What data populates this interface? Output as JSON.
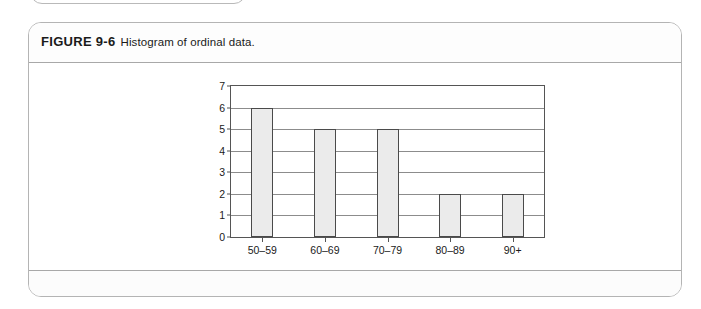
{
  "figure": {
    "label": "FIGURE 9-6",
    "description": "Histogram of ordinal data."
  },
  "chart_data": {
    "type": "bar",
    "title": "Histogram of ordinal data.",
    "categories": [
      "50–59",
      "60–69",
      "70–79",
      "80–89",
      "90+"
    ],
    "values": [
      6,
      5,
      5,
      2,
      2
    ],
    "xlabel": "",
    "ylabel": "",
    "ylim": [
      0,
      7
    ],
    "ytick_labels": [
      "0",
      "1",
      "2",
      "3",
      "4",
      "5",
      "6",
      "7"
    ],
    "ytick_values": [
      0,
      1,
      2,
      3,
      4,
      5,
      6,
      7
    ],
    "grid": true,
    "legend": false,
    "colors": {
      "bar_fill": "#ebebeb",
      "bar_border": "#4a4a4a",
      "gridline": "#8c8c8c",
      "axis": "#555555"
    }
  }
}
